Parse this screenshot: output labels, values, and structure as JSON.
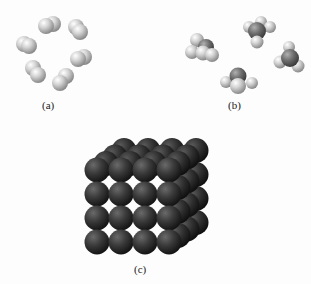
{
  "figure": {
    "panels": [
      {
        "id": "a",
        "label": "(a)",
        "description": "Six diatomic molecules (H2-like, two fused light-gray spheres) arranged in a ring",
        "molecule_count": 6,
        "color": "#c8c8c8"
      },
      {
        "id": "b",
        "label": "(b)",
        "description": "Four tetrahedral molecules (CH4-like: dark-gray central atom with light-gray surrounding atoms)",
        "molecule_count": 4,
        "central_atom_color": "#6e6e6e",
        "outer_atom_color": "#d4d4d4"
      },
      {
        "id": "c",
        "label": "(c)",
        "description": "Cubic lattice of dark spheres (4x4x4 close-packed metal crystal)",
        "grid": "4x4x4",
        "color": "#3a3a3a"
      }
    ]
  }
}
